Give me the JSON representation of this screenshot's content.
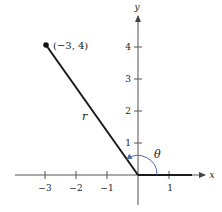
{
  "diagram": {
    "type": "polar-angle-diagram",
    "axes": {
      "x_label": "x",
      "y_label": "y",
      "x_ticks": [
        {
          "value": -3,
          "label": "−3"
        },
        {
          "value": -2,
          "label": "−2"
        },
        {
          "value": -1,
          "label": "−1"
        },
        {
          "value": 1,
          "label": "1"
        }
      ],
      "y_ticks": [
        {
          "value": 1,
          "label": "1"
        },
        {
          "value": 2,
          "label": "2"
        },
        {
          "value": 3,
          "label": "3"
        },
        {
          "value": 4,
          "label": "4"
        }
      ]
    },
    "point": {
      "x": -3,
      "y": 4,
      "label": "(−3, 4)"
    },
    "radius_label": "r",
    "angle_label": "θ",
    "colors": {
      "line": "#1a1a1a",
      "axis": "#444444",
      "arc": "#4a6fa5"
    }
  }
}
